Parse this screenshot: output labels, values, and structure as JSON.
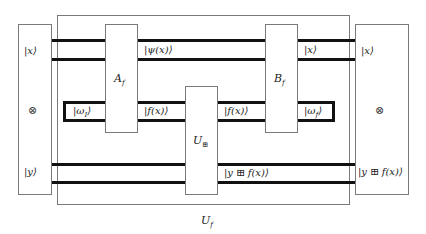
{
  "diagram": {
    "type": "quantum-circuit",
    "outer_box": {
      "label": "U",
      "label_sub": "f"
    },
    "left_register": {
      "top_state": "|x⟩",
      "tensor_symbol": "⊗",
      "bottom_state": "|y⟩"
    },
    "right_register": {
      "top_state": "|x⟩",
      "tensor_symbol": "⊗",
      "bottom_state": "|y ⊞ f(x)⟩"
    },
    "gates": [
      {
        "id": "A_f",
        "label": "A",
        "sub": "f"
      },
      {
        "id": "U_boxplus",
        "label": "U",
        "sub": "⊞"
      },
      {
        "id": "B_f",
        "label": "B",
        "sub": "f"
      }
    ],
    "wire_labels": {
      "psi": "|ψ(x)⟩",
      "x_out": "|x⟩",
      "omega_in": "|ω",
      "omega_in_sub": "I",
      "omega_in_close": "⟩",
      "f_after_A": "|f(x)⟩",
      "f_after_U": "|f(x)⟩",
      "omega_out": "|ω",
      "omega_out_sub": "f",
      "omega_out_close": "⟩",
      "y_sum": "|y ⊞ f(x)⟩"
    },
    "colors": {
      "wire": "#111111",
      "box_border": "#7a7a7a",
      "background": "#ffffff"
    }
  }
}
